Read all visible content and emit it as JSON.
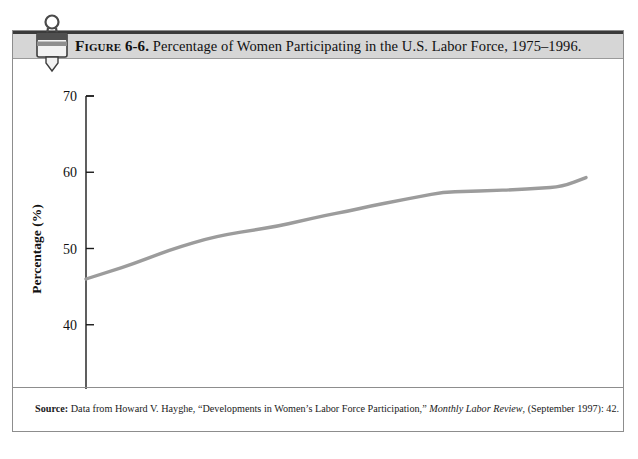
{
  "figure": {
    "label": "Figure",
    "number": "6-6.",
    "caption": "Percentage of Women Participating in the U.S. Labor Force, 1975–1996.",
    "icon": "binder-clip-icon"
  },
  "source": {
    "label": "Source:",
    "text_before_journal": " Data from Howard V. Hayghe, “Developments in Women’s Labor Force Participation,” ",
    "journal": "Monthly Labor Review",
    "text_after_journal": ", (September 1997): 42."
  },
  "chart_data": {
    "type": "line",
    "title": "Percentage of Women Participating in the U.S. Labor Force, 1975–1996.",
    "xlabel": "Year",
    "ylabel": "Percentage (%)",
    "xlim": [
      1975,
      1996
    ],
    "ylim": [
      30,
      70
    ],
    "xticks": [
      "1975",
      "1980",
      "1985",
      "1990",
      "1996"
    ],
    "xtick_values": [
      1975,
      1980,
      1985,
      1990,
      1996
    ],
    "yticks": [
      "30",
      "40",
      "50",
      "60",
      "70"
    ],
    "ytick_values": [
      30,
      40,
      50,
      60,
      70
    ],
    "grid": false,
    "legend": "none",
    "line_color": "#9c9c9c",
    "series": [
      {
        "name": "Percentage of women in labor force",
        "x": [
          1975,
          1976,
          1977,
          1978,
          1979,
          1980,
          1981,
          1982,
          1983,
          1984,
          1985,
          1986,
          1987,
          1988,
          1989,
          1990,
          1991,
          1992,
          1993,
          1994,
          1995,
          1996
        ],
        "values": [
          46.0,
          47.0,
          48.0,
          49.2,
          50.3,
          51.2,
          51.9,
          52.4,
          52.9,
          53.6,
          54.3,
          54.9,
          55.6,
          56.2,
          56.8,
          57.4,
          57.5,
          57.6,
          57.7,
          57.9,
          58.1,
          59.3
        ]
      }
    ]
  }
}
